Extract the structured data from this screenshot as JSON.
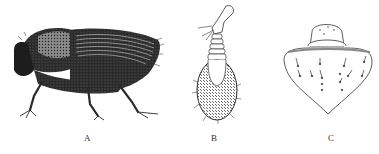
{
  "figure": {
    "panels": [
      {
        "id": "A",
        "label": "A",
        "subject": "beetle-lateral-view"
      },
      {
        "id": "B",
        "label": "B",
        "subject": "antenna-with-club"
      },
      {
        "id": "C",
        "label": "C",
        "subject": "pronotum-plate"
      }
    ],
    "colors": {
      "ink": "#1a1a1a",
      "background": "#ffffff",
      "label": "#333333"
    }
  }
}
